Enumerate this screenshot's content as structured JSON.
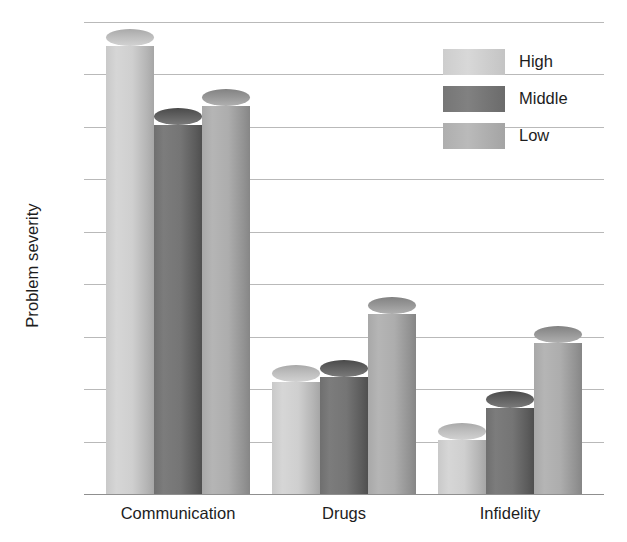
{
  "chart_data": {
    "type": "bar",
    "title": "",
    "subtitle": "",
    "xlabel": "",
    "ylabel": "Problem severity",
    "categories": [
      "Communication",
      "Drugs",
      "Infidelity"
    ],
    "series": [
      {
        "name": "High",
        "values": [
          43.5,
          11.5,
          6.0
        ],
        "color": "#cfcfcf"
      },
      {
        "name": "Middle",
        "values": [
          36.0,
          12.0,
          9.0
        ],
        "color": "#757575"
      },
      {
        "name": "Low",
        "values": [
          37.8,
          18.0,
          15.2
        ],
        "color": "#adadad"
      }
    ],
    "ylim": [
      0,
      45
    ],
    "ytick_values": [
      0,
      5,
      10,
      15,
      20,
      25,
      30,
      35,
      40,
      45
    ],
    "ytick_labels": [
      "0",
      "5",
      "10",
      "15",
      "20",
      "25",
      "30",
      "35",
      "40",
      "45"
    ],
    "ytick_step": 5,
    "grid": true,
    "grid_axis": "y",
    "legend": true,
    "legend_position": "top-right",
    "legend_entries": [
      "High",
      "Middle",
      "Low"
    ],
    "bar_style": "3d-cylinder",
    "background_color": "#ffffff",
    "gridline_color": "#b9b9b9",
    "axis_color": "#8f8f8f",
    "text_color": "#1d1d1d"
  }
}
